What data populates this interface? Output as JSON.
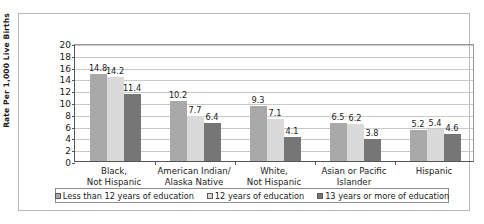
{
  "chart_data": {
    "type": "bar",
    "title": "",
    "xlabel": "",
    "ylabel": "Rate Per 1,000 Live Births",
    "ylim": [
      0,
      20
    ],
    "ytick_step": 2,
    "yticks": [
      "20",
      "18",
      "16",
      "14",
      "12",
      "10",
      "8",
      "6",
      "4",
      "2",
      "0"
    ],
    "grid": true,
    "legend_position": "bottom",
    "categories": [
      "Black,\nNot Hispanic",
      "American Indian/\nAlaska Native",
      "White,\nNot Hispanic",
      "Asian or Pacific\nIslander",
      "Hispanic"
    ],
    "category_lines": [
      [
        "Black,",
        "Not Hispanic"
      ],
      [
        "American Indian/",
        "Alaska Native"
      ],
      [
        "White,",
        "Not Hispanic"
      ],
      [
        "Asian or Pacific",
        "Islander"
      ],
      [
        "Hispanic",
        ""
      ]
    ],
    "series": [
      {
        "name": "Less than 12 years of education",
        "color": "#a9a9a9",
        "values": [
          14.8,
          10.2,
          9.3,
          6.5,
          5.2
        ],
        "labels": [
          "14.8",
          "10.2",
          "9.3",
          "6.5",
          "5.2"
        ]
      },
      {
        "name": "12 years of education",
        "color": "#dadada",
        "values": [
          14.2,
          7.7,
          7.1,
          6.2,
          5.4
        ],
        "labels": [
          "14.2",
          "7.7",
          "7.1",
          "6.2",
          "5.4"
        ]
      },
      {
        "name": "13 years or more of education",
        "color": "#767676",
        "values": [
          11.4,
          6.4,
          4.1,
          3.8,
          4.6
        ],
        "labels": [
          "11.4",
          "6.4",
          "4.1",
          "3.8",
          "4.6"
        ]
      }
    ]
  }
}
